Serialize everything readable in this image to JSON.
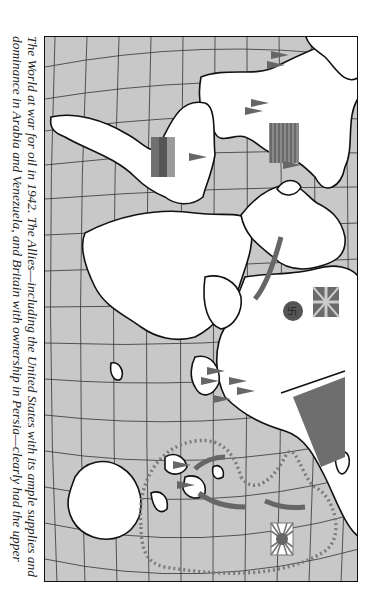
{
  "figure": {
    "caption_lines": [
      "The World at war for oil in 1942. The Allies—including the United States with its ample supplies and",
      "dominance in Arabia and Venezuela, and Britain with ownership in Persia—clearly had the upper"
    ],
    "orientation": "rotated 90 degrees clockwise",
    "colors": {
      "ocean": "#c8c8c8",
      "land": "#ffffff",
      "coast": "#111111",
      "grid": "#333333",
      "flag_dark": "#6a6a6a",
      "route_dots": "#7a7a7a",
      "arrow": "#666666"
    }
  },
  "map": {
    "title": "World at war for oil, 1942",
    "flags": [
      {
        "name": "united-states-flag",
        "label": "United States"
      },
      {
        "name": "united-kingdom-flag",
        "label": "Britain"
      },
      {
        "name": "nazi-germany-flag",
        "label": "Germany"
      },
      {
        "name": "soviet-union-flag",
        "label": "Soviet Union"
      },
      {
        "name": "japan-rising-sun-flag",
        "label": "Japan"
      },
      {
        "name": "venezuela-flag",
        "label": "Venezuela / South America"
      }
    ],
    "markers": [
      {
        "name": "oil-derrick-pennant",
        "region": "North America"
      },
      {
        "name": "oil-derrick-pennant",
        "region": "South America"
      },
      {
        "name": "oil-derrick-pennant",
        "region": "Middle East"
      },
      {
        "name": "oil-derrick-pennant",
        "region": "Dutch East Indies"
      }
    ],
    "routes": [
      {
        "name": "japanese-perimeter-dotted-route"
      },
      {
        "name": "german-advance-arrow"
      },
      {
        "name": "japanese-advance-arrows"
      }
    ]
  }
}
